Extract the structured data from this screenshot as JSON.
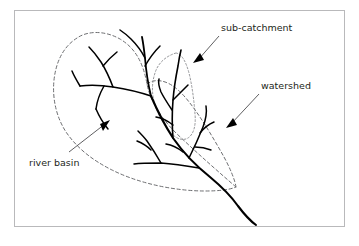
{
  "figure": {
    "type": "hydrology-schematic",
    "background_color": "#ffffff",
    "frame": {
      "name": "figure-border",
      "stroke_color": "#b9b9bb",
      "x": 14,
      "y": 10,
      "width": 331,
      "height": 217
    }
  },
  "labels": {
    "sub_catchment": "sub-catchment",
    "watershed": "watershed",
    "river_basin": "river basin"
  },
  "annotations": [
    {
      "id": "sub-catchment",
      "text": "sub-catchment",
      "text_x": 221,
      "text_y": 30,
      "leader_from": [
        218,
        36
      ],
      "leader_to": [
        196,
        61
      ],
      "arrow_tip": [
        193,
        63
      ],
      "color": "#231f20"
    },
    {
      "id": "watershed",
      "text": "watershed",
      "text_x": 261,
      "text_y": 88,
      "leader_from": [
        258,
        94
      ],
      "leader_to": [
        230,
        125
      ],
      "arrow_tip": [
        226,
        128
      ],
      "color": "#231f20"
    },
    {
      "id": "river-basin",
      "text": "river basin",
      "text_x": 29,
      "text_y": 165,
      "leader_from": [
        69,
        152
      ],
      "leader_to": [
        106,
        123
      ],
      "arrow_tip": [
        110,
        120
      ],
      "color": "#231f20"
    }
  ],
  "boundaries": [
    {
      "id": "river-basin-watershed-boundary",
      "style": "dashed",
      "stroke_color": "#6d6e71",
      "description": "Outer dashed boundary enclosing the whole river basin, converging to a point at the outlet"
    },
    {
      "id": "sub-catchment-boundary",
      "style": "dotted",
      "stroke_color": "#8a8b8e",
      "description": "Inner dotted boundary enclosing one sub-catchment of the basin"
    }
  ],
  "drainage_network": {
    "stroke_color": "#000000",
    "description": "Dendritic river network with a main stem exiting at the lower right of the basin",
    "main_stem": "flows from upper-left basin centre south-east through the outlet and off the figure"
  }
}
